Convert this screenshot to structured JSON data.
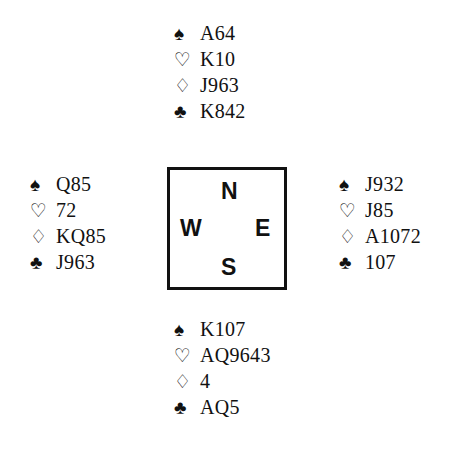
{
  "suit_symbols": {
    "spades": "♠",
    "hearts": "♡",
    "diamonds": "♢",
    "clubs": "♣"
  },
  "compass": {
    "north": "N",
    "west": "W",
    "east": "E",
    "south": "S"
  },
  "hands": {
    "north": {
      "spades": "A64",
      "hearts": "K10",
      "diamonds": "J963",
      "clubs": "K842"
    },
    "west": {
      "spades": "Q85",
      "hearts": "72",
      "diamonds": "KQ85",
      "clubs": "J963"
    },
    "east": {
      "spades": "J932",
      "hearts": "J85",
      "diamonds": "A1072",
      "clubs": "107"
    },
    "south": {
      "spades": "K107",
      "hearts": "AQ9643",
      "diamonds": "4",
      "clubs": "AQ5"
    }
  }
}
